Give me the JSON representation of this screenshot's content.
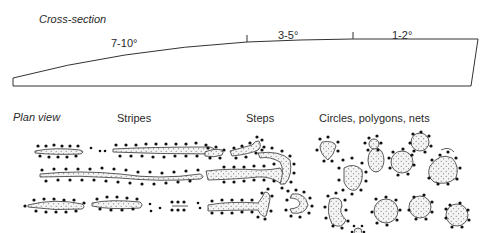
{
  "cross_section": {
    "title": "Cross-section",
    "segments": [
      {
        "label": "7-10°",
        "slope": "7-10",
        "unit": "°"
      },
      {
        "label": "3-5°",
        "slope": "3-5",
        "unit": "°"
      },
      {
        "label": "1-2°",
        "slope": "1-2",
        "unit": "°"
      }
    ]
  },
  "plan_view": {
    "title": "Plan view",
    "categories": [
      {
        "label": "Stripes"
      },
      {
        "label": "Steps"
      },
      {
        "label": "Circles, polygons, nets"
      }
    ]
  },
  "colors": {
    "line": "#333333",
    "dot": "#111111",
    "fill": "#f2f2f2",
    "stipple": "#555555"
  }
}
